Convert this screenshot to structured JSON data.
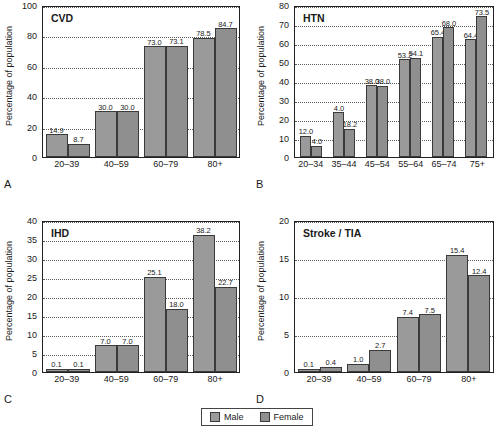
{
  "figure": {
    "legend": {
      "items": [
        {
          "label": "Male",
          "color": "#9a9a9a"
        },
        {
          "label": "Female",
          "color": "#8f8f8f"
        }
      ]
    }
  },
  "chart_data": [
    {
      "type": "bar",
      "panel": "A",
      "title": "CVD",
      "xlabel": "",
      "ylabel": "Percentage of population",
      "ylim": [
        0,
        100
      ],
      "yticks": [
        0,
        20,
        40,
        60,
        80,
        100
      ],
      "grid": true,
      "legend_position": "bottom-center",
      "categories": [
        "20–39",
        "40–59",
        "60–79",
        "80+"
      ],
      "series": [
        {
          "name": "Male",
          "values": [
            14.9,
            30.0,
            73.0,
            78.5
          ],
          "labels": [
            "14.9",
            "30.0",
            "73.0",
            "78.5"
          ]
        },
        {
          "name": "Female",
          "values": [
            8.7,
            30.0,
            73.1,
            84.7
          ],
          "labels": [
            "8.7",
            "30.0",
            "73.1",
            "84.7"
          ]
        }
      ]
    },
    {
      "type": "bar",
      "panel": "B",
      "title": "HTN",
      "xlabel": "",
      "ylabel": "Percentage of population",
      "ylim": [
        0,
        80
      ],
      "yticks": [
        0,
        10,
        20,
        30,
        40,
        50,
        60,
        70,
        80
      ],
      "grid": true,
      "categories": [
        "20–34",
        "35–44",
        "45–54",
        "55–64",
        "65–74",
        "75+"
      ],
      "series": [
        {
          "name": "Male",
          "values": [
            11.2,
            23.6,
            37.8,
            51.4,
            63.4,
            62.0
          ],
          "labels": [
            "12.0",
            "4.0",
            "38.0",
            "53.2",
            "65.4",
            "64.4"
          ]
        },
        {
          "name": "Female",
          "values": [
            6.0,
            15.0,
            37.6,
            52.2,
            68.2,
            74.2
          ],
          "labels": [
            "4.0",
            "18.2",
            "38.0",
            "54.1",
            "68.0",
            "73.5"
          ]
        }
      ]
    },
    {
      "type": "bar",
      "panel": "C",
      "title": "IHD",
      "xlabel": "",
      "ylabel": "Percentage of population",
      "ylim": [
        0,
        40
      ],
      "yticks": [
        0,
        5,
        10,
        15,
        20,
        25,
        30,
        35,
        40
      ],
      "grid": true,
      "categories": [
        "20–39",
        "40–59",
        "60–79",
        "80+"
      ],
      "series": [
        {
          "name": "Male",
          "values": [
            0.9,
            7.0,
            25.1,
            36.1
          ],
          "labels": [
            "0.1",
            "7.0",
            "25.1",
            "38.2"
          ]
        },
        {
          "name": "Female",
          "values": [
            0.9,
            7.1,
            16.7,
            22.4
          ],
          "labels": [
            "0.1",
            "7.0",
            "18.0",
            "22.7"
          ]
        }
      ]
    },
    {
      "type": "bar",
      "panel": "D",
      "title": "Stroke / TIA",
      "xlabel": "",
      "ylabel": "Percentage of population",
      "ylim": [
        0,
        20
      ],
      "yticks": [
        0,
        5,
        10,
        15,
        20
      ],
      "grid": true,
      "categories": [
        "20–39",
        "40–59",
        "60–79",
        "80+"
      ],
      "series": [
        {
          "name": "Male",
          "values": [
            0.4,
            1.1,
            7.3,
            15.4
          ],
          "labels": [
            "0.1",
            "1.0",
            "7.4",
            "15.4"
          ]
        },
        {
          "name": "Female",
          "values": [
            0.7,
            2.9,
            7.6,
            12.7
          ],
          "labels": [
            "0.4",
            "2.7",
            "7.5",
            "12.4"
          ]
        }
      ]
    }
  ]
}
